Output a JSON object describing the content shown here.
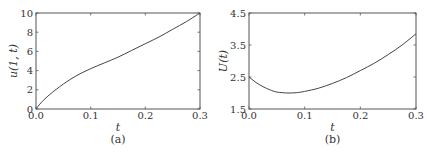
{
  "chart_data": [
    {
      "type": "line",
      "panel": "(a)",
      "title": "",
      "xlabel": "t",
      "ylabel": "u(1, t)",
      "xlim": [
        0.0,
        0.3
      ],
      "ylim": [
        0,
        10
      ],
      "xticks": [
        "0.0",
        "0.1",
        "0.2",
        "0.3"
      ],
      "yticks": [
        "0",
        "2",
        "4",
        "6",
        "8",
        "10"
      ],
      "grid": false,
      "legend": null,
      "series": [
        {
          "name": "u(1, t)",
          "x": [
            0.0,
            0.01,
            0.025,
            0.05,
            0.075,
            0.1,
            0.125,
            0.15,
            0.175,
            0.2,
            0.225,
            0.25,
            0.275,
            0.3
          ],
          "y": [
            0.0,
            0.7,
            1.5,
            2.6,
            3.5,
            4.2,
            4.8,
            5.4,
            6.1,
            6.8,
            7.5,
            8.3,
            9.1,
            10.0
          ]
        }
      ]
    },
    {
      "type": "line",
      "panel": "(b)",
      "title": "",
      "xlabel": "t",
      "ylabel": "U(t)",
      "xlim": [
        0.0,
        0.3
      ],
      "ylim": [
        1.5,
        4.5
      ],
      "xticks": [
        "0.0",
        "0.1",
        "0.2",
        "0.3"
      ],
      "yticks": [
        "1.5",
        "2.5",
        "3.5",
        "4.5"
      ],
      "grid": false,
      "legend": null,
      "series": [
        {
          "name": "U(t)",
          "x": [
            0.0,
            0.0125,
            0.025,
            0.0375,
            0.05,
            0.07,
            0.085,
            0.1,
            0.125,
            0.15,
            0.175,
            0.2,
            0.225,
            0.25,
            0.275,
            0.3
          ],
          "y": [
            2.5,
            2.33,
            2.2,
            2.1,
            2.03,
            2.0,
            2.01,
            2.05,
            2.15,
            2.3,
            2.48,
            2.7,
            2.93,
            3.2,
            3.5,
            3.85
          ]
        }
      ]
    }
  ],
  "panels": [
    {
      "caption": "(a)",
      "xlabel": "t",
      "ylabel": "u(1, t)"
    },
    {
      "caption": "(b)",
      "xlabel": "t",
      "ylabel": "U(t)"
    }
  ],
  "style": {
    "axis_color": "#555555",
    "line_color": "#444444",
    "text_color": "#333333"
  }
}
